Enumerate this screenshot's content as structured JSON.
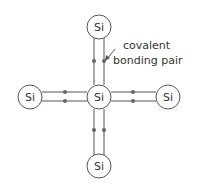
{
  "diagram": {
    "title": "",
    "atoms": [
      {
        "id": "top",
        "label": "Si",
        "cx": 99,
        "cy": 27
      },
      {
        "id": "left",
        "label": "Si",
        "cx": 30,
        "cy": 97
      },
      {
        "id": "center",
        "label": "Si",
        "cx": 99,
        "cy": 97
      },
      {
        "id": "right",
        "label": "Si",
        "cx": 168,
        "cy": 97
      },
      {
        "id": "bottom",
        "label": "Si",
        "cx": 99,
        "cy": 166
      }
    ],
    "annotation": {
      "line1": "covalent",
      "line2": "bonding pair"
    },
    "colors": {
      "stroke": "#555555",
      "dot": "#666666"
    }
  }
}
